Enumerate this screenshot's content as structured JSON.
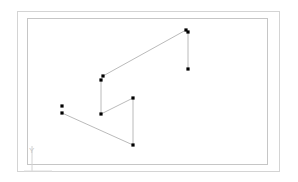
{
  "document": {
    "title": "CAD Polyline Sketch",
    "background_color": "#ffffff",
    "canvas_width": 298,
    "canvas_height": 182
  },
  "frame": {
    "outer": {
      "x": 17,
      "y": 11,
      "width": 263,
      "height": 161,
      "stroke": "#d0d0d0",
      "stroke_width": 1
    },
    "inner": {
      "x": 27,
      "y": 18,
      "width": 241,
      "height": 147,
      "stroke": "#c4c4c4",
      "stroke_width": 1
    }
  },
  "axis_indicator": {
    "label": "Y",
    "color": "#cccccc",
    "vertical_line": {
      "x1": 32,
      "y1": 146,
      "x2": 32,
      "y2": 171
    },
    "horizontal_line": {
      "x1": 24,
      "y1": 171,
      "x2": 52,
      "y2": 171
    },
    "label_position": {
      "x": 30,
      "y": 152
    }
  },
  "chart_data": {
    "type": "line",
    "title": "",
    "xlabel": "",
    "ylabel": "Y",
    "marker": "square",
    "marker_color": "#000000",
    "line_color": "#a8a8a8",
    "line_width": 0.8,
    "polyline_vertices": [
      {
        "id": "v1",
        "x": 62,
        "y": 106,
        "label": "p1"
      },
      {
        "id": "v2",
        "x": 62,
        "y": 113,
        "label": "p2"
      },
      {
        "id": "v3",
        "x": 133,
        "y": 145,
        "label": "p3"
      },
      {
        "id": "v4",
        "x": 133,
        "y": 98,
        "label": "p4"
      },
      {
        "id": "v5",
        "x": 101,
        "y": 114,
        "label": "p5"
      },
      {
        "id": "v6",
        "x": 101,
        "y": 80,
        "label": "p6"
      },
      {
        "id": "v7",
        "x": 103,
        "y": 76,
        "label": "p7"
      },
      {
        "id": "v8",
        "x": 186,
        "y": 30,
        "label": "p8"
      },
      {
        "id": "v9",
        "x": 188,
        "y": 32,
        "label": "p9"
      },
      {
        "id": "v10",
        "x": 188,
        "y": 69,
        "label": "p10"
      }
    ],
    "segments": [
      {
        "from": "v2",
        "to": "v3"
      },
      {
        "from": "v3",
        "to": "v4"
      },
      {
        "from": "v4",
        "to": "v5"
      },
      {
        "from": "v5",
        "to": "v6"
      },
      {
        "from": "v7",
        "to": "v8"
      },
      {
        "from": "v9",
        "to": "v10"
      }
    ],
    "grid": false,
    "legend": "none"
  }
}
